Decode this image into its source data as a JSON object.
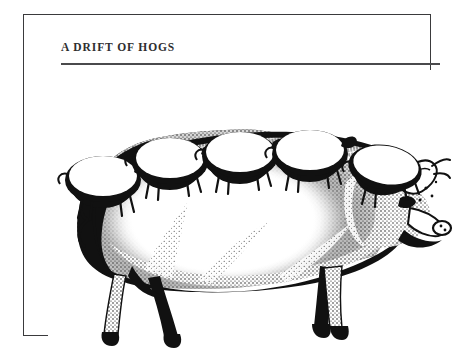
{
  "page": {
    "background_color": "#ffffff",
    "width": 451,
    "height": 355
  },
  "frame": {
    "border_color": "#3a3a3c",
    "border_width_px": 1
  },
  "header": {
    "title": "A DRIFT OF HOGS",
    "title_color": "#2e2e30",
    "rule_color": "#4a4a4c"
  },
  "illustration": {
    "caption": "A DRIFT OF HOGS",
    "style": "pen-and-ink stipple engraving",
    "ink_color": "#111111",
    "background_color": "#ffffff",
    "subject": "large hog in profile facing right",
    "small_hogs_count": 5,
    "small_hogs_description": "five small hogs standing in a row along the large hog's back",
    "large_hog_features": [
      "curly tail at left rear",
      "two hind legs",
      "two front legs",
      "upright pointed ear",
      "snout facing right",
      "stippled shading along belly and flank",
      "bristled ridge along the back"
    ]
  }
}
